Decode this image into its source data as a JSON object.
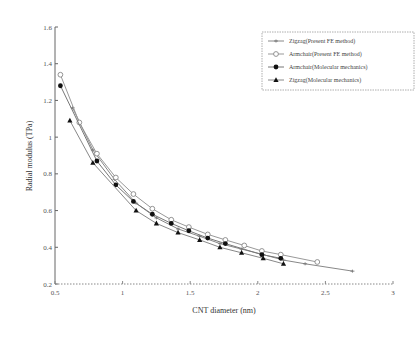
{
  "chart_data": {
    "type": "line",
    "title": "",
    "xlabel": "CNT diameter (nm)",
    "ylabel": "Radial modulus (TPa)",
    "xlim": [
      0.5,
      3
    ],
    "ylim": [
      0.2,
      1.6
    ],
    "xticks": [
      0.5,
      1,
      1.5,
      2,
      2.5,
      3
    ],
    "xtick_labels": [
      "0.5",
      "1",
      "1.5",
      "2",
      "2.5",
      "3"
    ],
    "yticks": [
      0.2,
      0.4,
      0.6,
      0.8,
      1.0,
      1.2,
      1.4,
      1.6
    ],
    "ytick_labels": [
      "0.2",
      "0.4",
      "0.6",
      "0.8",
      "1",
      "1.2",
      "1.4",
      "1.6"
    ],
    "grid": false,
    "legend_position": "upper right",
    "series": [
      {
        "name": "Zigzag(Present FE method)",
        "marker": "x-open",
        "x": [
          0.63,
          0.78,
          0.94,
          1.1,
          1.25,
          1.41,
          1.57,
          1.72,
          1.88,
          2.04,
          2.19,
          2.35,
          2.7
        ],
        "y": [
          1.16,
          0.93,
          0.77,
          0.64,
          0.56,
          0.5,
          0.46,
          0.42,
          0.39,
          0.36,
          0.33,
          0.31,
          0.27
        ]
      },
      {
        "name": "Armchair(Present FE method)",
        "marker": "circle-open",
        "x": [
          0.54,
          0.68,
          0.81,
          0.95,
          1.08,
          1.22,
          1.36,
          1.49,
          1.63,
          1.76,
          1.9,
          2.03,
          2.17,
          2.44
        ],
        "y": [
          1.34,
          1.08,
          0.91,
          0.78,
          0.69,
          0.61,
          0.55,
          0.51,
          0.47,
          0.44,
          0.41,
          0.38,
          0.36,
          0.32
        ]
      },
      {
        "name": "Armchair(Molecular mechanics)",
        "marker": "circle-filled",
        "x": [
          0.54,
          0.81,
          0.95,
          1.08,
          1.22,
          1.36,
          1.49,
          1.63,
          1.76,
          2.03,
          2.17
        ],
        "y": [
          1.28,
          0.87,
          0.74,
          0.65,
          0.58,
          0.53,
          0.49,
          0.45,
          0.42,
          0.36,
          0.34
        ]
      },
      {
        "name": "Zigzag(Molecular mechanics)",
        "marker": "triangle-filled",
        "x": [
          0.61,
          0.78,
          1.1,
          1.25,
          1.41,
          1.57,
          1.72,
          1.88,
          2.04,
          2.19
        ],
        "y": [
          1.09,
          0.86,
          0.6,
          0.53,
          0.48,
          0.44,
          0.4,
          0.37,
          0.34,
          0.31
        ]
      }
    ]
  },
  "plot": {
    "left": 55,
    "right": 393,
    "top": 27,
    "bottom": 284
  }
}
